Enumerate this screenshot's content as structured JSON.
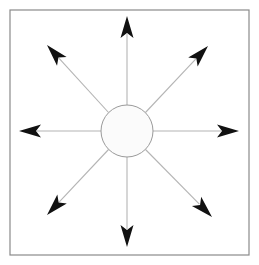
{
  "figure": {
    "background_color": "#ffffff",
    "width": 259,
    "height": 265
  },
  "frame": {
    "name": "outer-border-rectangle",
    "x": 10,
    "y": 10,
    "width": 239,
    "height": 245,
    "stroke_color": "#8a8a8a",
    "stroke_width": 1.2,
    "fill": "none"
  },
  "hub": {
    "name": "central-circle",
    "center_x": 127,
    "center_y": 131,
    "radius": 26,
    "fill_color": "#fbfbfb",
    "stroke_color": "#9a9a9a",
    "stroke_width": 1
  },
  "arrow_style": {
    "shaft_color": "#b4b4b4",
    "shaft_width": 1.1,
    "head_color": "#111111",
    "head_length": 22,
    "head_half_width": 6.5
  },
  "arrows": [
    {
      "name": "arrow-up",
      "direction": "up",
      "angle_deg": 90,
      "tip_x": 127,
      "tip_y": 16,
      "tail_x": 127,
      "tail_y": 105
    },
    {
      "name": "arrow-upper-right",
      "direction": "upper-right",
      "angle_deg": 45,
      "tip_x": 208,
      "tip_y": 46,
      "tail_x": 145,
      "tail_y": 113
    },
    {
      "name": "arrow-right",
      "direction": "right",
      "angle_deg": 0,
      "tip_x": 239,
      "tip_y": 131,
      "tail_x": 153,
      "tail_y": 131
    },
    {
      "name": "arrow-lower-right",
      "direction": "lower-right",
      "angle_deg": -45,
      "tip_x": 212,
      "tip_y": 217,
      "tail_x": 145,
      "tail_y": 149
    },
    {
      "name": "arrow-down",
      "direction": "down",
      "angle_deg": -90,
      "tip_x": 127,
      "tip_y": 247,
      "tail_x": 127,
      "tail_y": 157
    },
    {
      "name": "arrow-lower-left",
      "direction": "lower-left",
      "angle_deg": -135,
      "tip_x": 47,
      "tip_y": 215,
      "tail_x": 109,
      "tail_y": 149
    },
    {
      "name": "arrow-left",
      "direction": "left",
      "angle_deg": 180,
      "tip_x": 19,
      "tip_y": 131,
      "tail_x": 101,
      "tail_y": 131
    },
    {
      "name": "arrow-upper-left",
      "direction": "upper-left",
      "angle_deg": 135,
      "tip_x": 47,
      "tip_y": 45,
      "tail_x": 109,
      "tail_y": 113
    }
  ]
}
